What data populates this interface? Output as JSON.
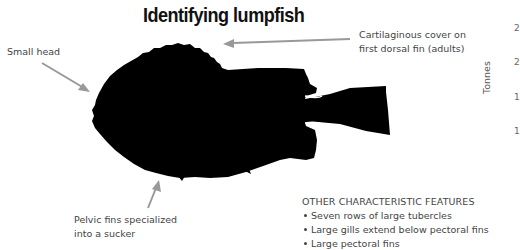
{
  "title": "Identifying lumpfish",
  "callouts": {
    "small_head": "Small head",
    "dorsal_line1": "Cartilaginous cover on",
    "dorsal_line2": "first dorsal fin (adults)",
    "pelvic_line1": "Pelvic fins specialized",
    "pelvic_line2": "into a sucker"
  },
  "features": {
    "heading": "OTHER CHARACTERISTIC FEATURES",
    "items": [
      "Seven rows of large tubercles",
      "Large gills extend below pectoral fins",
      "Large pectoral fins"
    ]
  },
  "partial_chart": {
    "ylabel": "Tonnes",
    "tick_fragments": [
      "2",
      "2",
      "1",
      "1"
    ]
  },
  "colors": {
    "silhouette": "#000000",
    "arrow": "#999999",
    "text": "#444444"
  }
}
